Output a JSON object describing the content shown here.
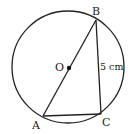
{
  "diagram": {
    "type": "geometry-circle",
    "circle": {
      "cx": 68,
      "cy": 67,
      "r": 56,
      "center_label": "O"
    },
    "points": {
      "A": {
        "x": 43,
        "y": 116,
        "label": "A"
      },
      "B": {
        "x": 96,
        "y": 20,
        "label": "B"
      },
      "C": {
        "x": 101,
        "y": 114,
        "label": "C"
      },
      "O": {
        "x": 68,
        "y": 68,
        "label": "O"
      }
    },
    "segments": [
      "AB",
      "BC",
      "CA"
    ],
    "measurement": {
      "segment": "BC",
      "label": "5 cm"
    }
  }
}
